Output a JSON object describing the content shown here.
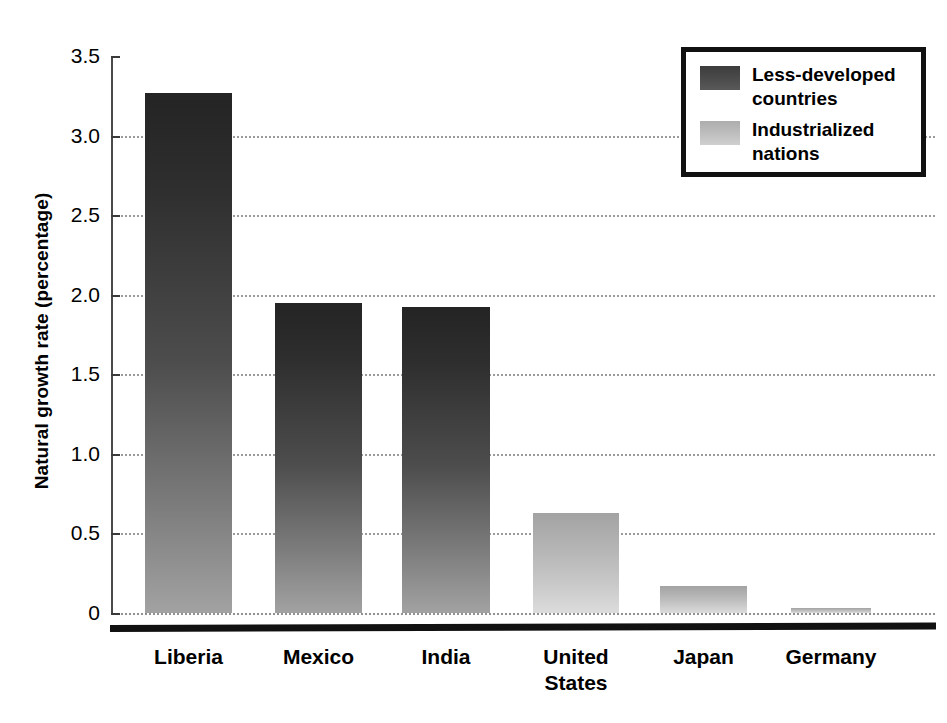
{
  "chart_data": {
    "type": "bar",
    "title": "",
    "subtitle": "",
    "xlabel": "",
    "ylabel": "Natural growth rate (percentage)",
    "categories": [
      "Liberia",
      "Mexico",
      "India",
      "United\nStates",
      "Japan",
      "Germany"
    ],
    "values": [
      3.27,
      1.95,
      1.92,
      0.63,
      0.17,
      0.03
    ],
    "group_of_category": [
      "Less-developed countries",
      "Less-developed countries",
      "Less-developed countries",
      "Industrialized nations",
      "Industrialized nations",
      "Industrialized nations"
    ],
    "ylim": [
      0,
      3.5
    ],
    "yticks": [
      0,
      0.5,
      1.0,
      1.5,
      2.0,
      2.5,
      3.0,
      3.5
    ],
    "ytick_labels": [
      "0",
      "0.5",
      "1.0",
      "1.5",
      "2.0",
      "2.5",
      "3.0",
      "3.5"
    ],
    "grid": "horizontal-dotted",
    "legend_position": "top-right",
    "legend": [
      {
        "label": "Less-developed\ncountries",
        "color": "#4a4a4a"
      },
      {
        "label": "Industrialized\nnations",
        "color": "#bdbdbd"
      }
    ],
    "colors": {
      "less_developed": "#4a4a4a",
      "industrialized": "#bdbdbd",
      "axis": "#111111",
      "gridline": "#9a9a9a",
      "background": "#ffffff"
    }
  }
}
